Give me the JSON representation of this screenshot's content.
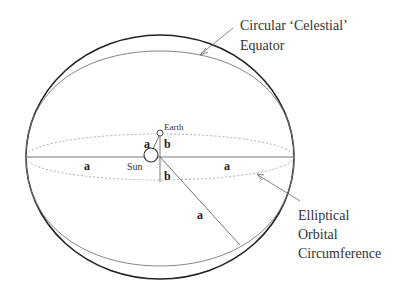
{
  "labels": {
    "celestial_equator_line1": "Circular ‘Celestial’",
    "celestial_equator_line2": "Equator",
    "elliptical_line1": "Elliptical",
    "elliptical_line2": "Orbital",
    "elliptical_line3": "Circumference",
    "earth": "Earth",
    "sun": "Sun",
    "a_left": "a",
    "a_right": "a",
    "a_near_sun": "a",
    "a_diagonal": "a",
    "b_upper": "b",
    "b_lower": "b"
  },
  "colors": {
    "outer_ellipse": "#222222",
    "inner_arc": "#777777",
    "dashed_orbit": "#999999",
    "lines": "#666666",
    "text": "#333333"
  }
}
